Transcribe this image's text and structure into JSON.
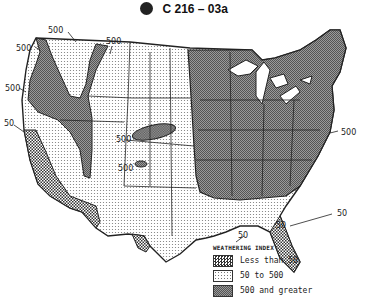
{
  "header": {
    "logo": "astm-logo",
    "designation": "C 216 – 03a"
  },
  "map": {
    "title": "Weathering index map of the United States",
    "region_labels": [
      {
        "text": "500",
        "x": 16,
        "y": 51
      },
      {
        "text": "500",
        "x": 48,
        "y": 33
      },
      {
        "text": "500",
        "x": 106,
        "y": 44
      },
      {
        "text": "500",
        "x": 5,
        "y": 91
      },
      {
        "text": "50",
        "x": 4,
        "y": 126
      },
      {
        "text": "500",
        "x": 116,
        "y": 142
      },
      {
        "text": "500",
        "x": 118,
        "y": 171
      },
      {
        "text": "500",
        "x": 341,
        "y": 135
      },
      {
        "text": "50",
        "x": 337,
        "y": 216
      },
      {
        "text": "50",
        "x": 276,
        "y": 228
      },
      {
        "text": "50",
        "x": 238,
        "y": 238
      }
    ]
  },
  "legend": {
    "title": "WEATHERING INDEX",
    "items": [
      {
        "label": "Less than 50",
        "pattern": "dense-checker"
      },
      {
        "label": "50 to 500",
        "pattern": "light-dots"
      },
      {
        "label": "500 and greater",
        "pattern": "dark-checker"
      }
    ]
  }
}
